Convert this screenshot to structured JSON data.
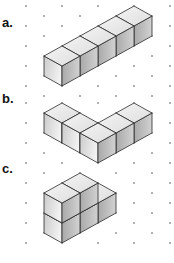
{
  "colors": {
    "background": "#ffffff",
    "edge": "#2a2a2a",
    "dot": "#8c8c8c",
    "top_face_light": "#f4f4f4",
    "top_face_dark": "#dedede",
    "left_face_light": "#f2f2f2",
    "left_face_dark": "#cbcbcb",
    "right_face_light": "#d2d2d2",
    "right_face_dark": "#a9a9a9"
  },
  "projection": {
    "u": [
      18,
      -10
    ],
    "v": [
      18,
      10
    ],
    "w": [
      0,
      -20
    ]
  },
  "grid": {
    "type": "isometric-dot-grid",
    "x0": 26,
    "dx": 18,
    "dy": 20,
    "cols": 9,
    "dot_radius": 0.9,
    "panels": [
      {
        "even_y0": 6,
        "even_y1": 86,
        "odd_y0": 16,
        "odd_y1": 96
      },
      {
        "even_y0": 103,
        "even_y1": 243,
        "odd_y0": 113,
        "odd_y1": 233
      }
    ]
  },
  "figures": [
    {
      "label": "a.",
      "description": "5 cubes in a straight row",
      "cube_count": 5,
      "origin": [
        44,
        76
      ],
      "cubes": [
        [
          0,
          0,
          0
        ],
        [
          1,
          0,
          0
        ],
        [
          2,
          0,
          0
        ],
        [
          3,
          0,
          0
        ],
        [
          4,
          0,
          0
        ]
      ]
    },
    {
      "label": "b.",
      "description": "5 cubes in an L shape",
      "cube_count": 5,
      "origin": [
        44,
        133
      ],
      "cubes": [
        [
          0,
          0,
          0
        ],
        [
          0,
          1,
          0
        ],
        [
          0,
          2,
          0
        ],
        [
          1,
          2,
          0
        ],
        [
          2,
          2,
          0
        ]
      ]
    },
    {
      "label": "c.",
      "description": "3 cubes on the bottom layer, 2 stacked on top",
      "cube_count": 5,
      "origin": [
        44,
        233
      ],
      "cubes": [
        [
          0,
          0,
          0
        ],
        [
          1,
          0,
          0
        ],
        [
          2,
          0,
          0
        ],
        [
          0,
          0,
          1
        ],
        [
          1,
          0,
          1
        ]
      ]
    }
  ]
}
